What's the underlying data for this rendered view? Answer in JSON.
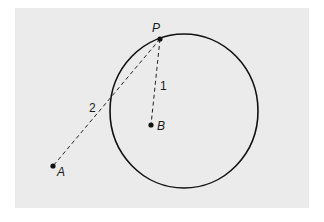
{
  "diagram": {
    "background_color": "#ebebeb",
    "stroke_color": "#111111",
    "points": [
      {
        "id": "P",
        "label": "P",
        "x": 160,
        "y": 39
      },
      {
        "id": "B",
        "label": "B",
        "x": 151,
        "y": 125
      },
      {
        "id": "A",
        "label": "A",
        "x": 53,
        "y": 166
      }
    ],
    "circle": {
      "cx": 184,
      "cy": 111,
      "rx": 74,
      "ry": 77
    },
    "segments": [
      {
        "from": "P",
        "to": "B",
        "style": "dashed",
        "label": "1"
      },
      {
        "from": "P",
        "to": "A",
        "style": "dashed",
        "label": "2"
      }
    ],
    "labels": {
      "P": "P",
      "B": "B",
      "A": "A",
      "seg1": "1",
      "seg2": "2"
    }
  }
}
